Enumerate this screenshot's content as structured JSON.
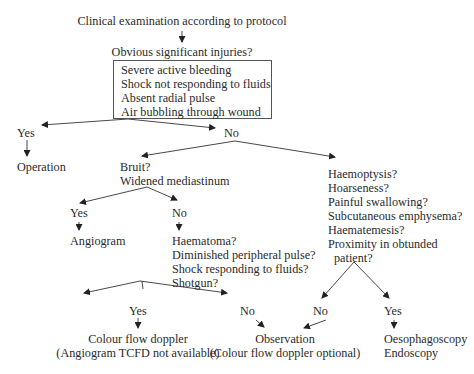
{
  "flowchart": {
    "start": "Clinical examination according to protocol",
    "q1": {
      "question": "Obvious significant injuries?",
      "criteria": [
        "Severe active bleeding",
        "Shock not responding to fluids",
        "Absent radial pulse",
        "Air bubbling through wound"
      ],
      "yes_label": "Yes",
      "no_label": "No",
      "yes_outcome": "Operation"
    },
    "vascular": {
      "question_line1": "Bruit?",
      "question_line2": "Widened mediastinum",
      "yes_label": "Yes",
      "no_label": "No",
      "yes_outcome": "Angiogram",
      "sub_questions": [
        "Haematoma?",
        "Diminished peripheral pulse?",
        "Shock responding to fluids?",
        "Shotgun?"
      ],
      "sub_yes_label": "Yes",
      "sub_no_label": "No",
      "sub_yes_outcome_line1": "Colour flow doppler",
      "sub_yes_outcome_line2": "(Angiogram TCFD not available)"
    },
    "aerodigestive": {
      "questions": [
        "Haemoptysis?",
        "Hoarseness?",
        "Painful swallowing?",
        "Subcutaneous emphysema?",
        "Haematemesis?",
        "Proximity in obtunded",
        "patient?"
      ],
      "no_label": "No",
      "yes_label": "Yes",
      "yes_outcome_line1": "Oesophagoscopy",
      "yes_outcome_line2": "Endoscopy"
    },
    "observation_line1": "Observation",
    "observation_line2": "(Colour flow doppler optional)"
  }
}
